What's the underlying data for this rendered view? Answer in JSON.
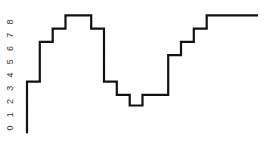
{
  "chart_data": {
    "type": "line",
    "style": "step",
    "title": "",
    "xlabel": "",
    "ylabel": "",
    "ylim": [
      -0.4,
      8.5
    ],
    "yticks": [
      "0",
      "1",
      "2",
      "3",
      "4",
      "5",
      "6",
      "7",
      "8"
    ],
    "ytick_rotation": -90,
    "grid": false,
    "legend": null,
    "start_value": -0.4,
    "series": [
      {
        "name": "series-1",
        "color": "#111111",
        "values": [
          3.5,
          6.5,
          7.5,
          8.5,
          8.5,
          7.5,
          3.5,
          2.5,
          1.7,
          2.5,
          2.5,
          5.5,
          6.5,
          7.5,
          8.5,
          8.5,
          8.5,
          8.5
        ]
      }
    ]
  }
}
